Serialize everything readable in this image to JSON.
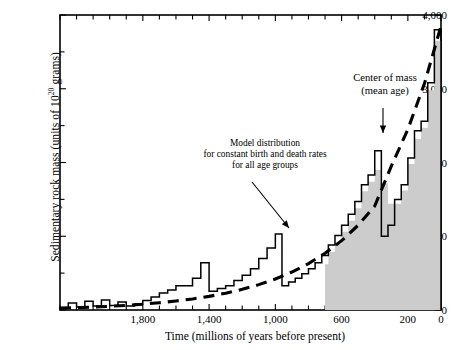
{
  "chart_data": {
    "type": "area",
    "title": "",
    "xlabel": "Time (millions of years before present)",
    "ylabel": "Sedimentary rock mass (units of 10",
    "ylabel_sup": "20",
    "ylabel_tail": " grams)",
    "xlim": [
      2300,
      0
    ],
    "ylim": [
      0,
      4000
    ],
    "x_direction": "decreasing",
    "grid": false,
    "legend": false,
    "xticks": [
      1800,
      1400,
      1000,
      600,
      200,
      0
    ],
    "xticklabels": [
      "1,800",
      "1,400",
      "1,000",
      "600",
      "200",
      "0"
    ],
    "yticks": [
      0,
      1000,
      2000,
      3000,
      4000
    ],
    "yticklabels": [
      "0",
      "1,000",
      "2,000",
      "3,000",
      "4,000"
    ],
    "x_minor_tick_step": 100,
    "y_minor_tick_step": 500,
    "annotations": [
      {
        "name": "model-distribution-annotation",
        "lines": [
          "Model distribution",
          "for constant birth and death rates",
          "for all age groups"
        ],
        "text_x": 265,
        "text_y": 155,
        "arrow_from": [
          252,
          182
        ],
        "arrow_to": [
          289,
          228
        ]
      },
      {
        "name": "center-of-mass-annotation",
        "lines": [
          "Center of mass",
          "(mean age)"
        ],
        "text_x": 385,
        "text_y": 85,
        "arrow_from": [
          383,
          108
        ],
        "arrow_to": [
          383,
          133
        ]
      }
    ],
    "series": [
      {
        "name": "observed-sedimentary-mass",
        "style": "step-outline",
        "color": "#000000",
        "description": "Observed sedimentary rock mass histogram (open staircase outline)",
        "steps": [
          {
            "x0": 2300,
            "x1": 2250,
            "y": 30
          },
          {
            "x0": 2250,
            "x1": 2200,
            "y": 95
          },
          {
            "x0": 2200,
            "x1": 2150,
            "y": 40
          },
          {
            "x0": 2150,
            "x1": 2100,
            "y": 120
          },
          {
            "x0": 2100,
            "x1": 2050,
            "y": 55
          },
          {
            "x0": 2050,
            "x1": 2000,
            "y": 135
          },
          {
            "x0": 2000,
            "x1": 1950,
            "y": 60
          },
          {
            "x0": 1950,
            "x1": 1900,
            "y": 110
          },
          {
            "x0": 1900,
            "x1": 1850,
            "y": 55
          },
          {
            "x0": 1850,
            "x1": 1800,
            "y": 80
          },
          {
            "x0": 1800,
            "x1": 1750,
            "y": 130
          },
          {
            "x0": 1750,
            "x1": 1700,
            "y": 175
          },
          {
            "x0": 1700,
            "x1": 1650,
            "y": 230
          },
          {
            "x0": 1650,
            "x1": 1600,
            "y": 270
          },
          {
            "x0": 1600,
            "x1": 1500,
            "y": 330
          },
          {
            "x0": 1500,
            "x1": 1450,
            "y": 430
          },
          {
            "x0": 1450,
            "x1": 1400,
            "y": 640
          },
          {
            "x0": 1400,
            "x1": 1350,
            "y": 255
          },
          {
            "x0": 1350,
            "x1": 1300,
            "y": 290
          },
          {
            "x0": 1300,
            "x1": 1250,
            "y": 330
          },
          {
            "x0": 1250,
            "x1": 1200,
            "y": 400
          },
          {
            "x0": 1200,
            "x1": 1150,
            "y": 470
          },
          {
            "x0": 1150,
            "x1": 1100,
            "y": 560
          },
          {
            "x0": 1100,
            "x1": 1050,
            "y": 700
          },
          {
            "x0": 1050,
            "x1": 1000,
            "y": 840
          },
          {
            "x0": 1000,
            "x1": 960,
            "y": 1030
          },
          {
            "x0": 960,
            "x1": 920,
            "y": 330
          },
          {
            "x0": 920,
            "x1": 880,
            "y": 380
          },
          {
            "x0": 880,
            "x1": 840,
            "y": 430
          },
          {
            "x0": 840,
            "x1": 800,
            "y": 490
          },
          {
            "x0": 800,
            "x1": 760,
            "y": 560
          },
          {
            "x0": 760,
            "x1": 720,
            "y": 640
          },
          {
            "x0": 720,
            "x1": 680,
            "y": 740
          },
          {
            "x0": 680,
            "x1": 640,
            "y": 880
          },
          {
            "x0": 640,
            "x1": 600,
            "y": 1010
          },
          {
            "x0": 600,
            "x1": 560,
            "y": 1150
          },
          {
            "x0": 560,
            "x1": 520,
            "y": 1300
          },
          {
            "x0": 520,
            "x1": 480,
            "y": 1470
          },
          {
            "x0": 480,
            "x1": 440,
            "y": 1700
          },
          {
            "x0": 440,
            "x1": 400,
            "y": 1830
          },
          {
            "x0": 400,
            "x1": 360,
            "y": 2160
          },
          {
            "x0": 360,
            "x1": 320,
            "y": 1000
          },
          {
            "x0": 320,
            "x1": 280,
            "y": 1150
          },
          {
            "x0": 280,
            "x1": 240,
            "y": 1500
          },
          {
            "x0": 240,
            "x1": 200,
            "y": 1700
          },
          {
            "x0": 200,
            "x1": 160,
            "y": 2060
          },
          {
            "x0": 160,
            "x1": 120,
            "y": 2430
          },
          {
            "x0": 120,
            "x1": 80,
            "y": 2560
          },
          {
            "x0": 80,
            "x1": 40,
            "y": 3080
          },
          {
            "x0": 40,
            "x1": 0,
            "y": 3800
          }
        ]
      },
      {
        "name": "phanerozoic-shaded-mass",
        "style": "step-filled",
        "color": "#cccccc",
        "description": "Shaded (Phanerozoic) portion of observed mass, begins near 700 Ma",
        "steps": [
          {
            "x0": 700,
            "x1": 680,
            "y": 620
          },
          {
            "x0": 680,
            "x1": 640,
            "y": 790
          },
          {
            "x0": 640,
            "x1": 600,
            "y": 900
          },
          {
            "x0": 600,
            "x1": 560,
            "y": 1060
          },
          {
            "x0": 560,
            "x1": 520,
            "y": 1210
          },
          {
            "x0": 520,
            "x1": 480,
            "y": 1380
          },
          {
            "x0": 480,
            "x1": 440,
            "y": 1610
          },
          {
            "x0": 440,
            "x1": 400,
            "y": 1740
          },
          {
            "x0": 400,
            "x1": 360,
            "y": 1900
          },
          {
            "x0": 360,
            "x1": 320,
            "y": 1720
          },
          {
            "x0": 320,
            "x1": 280,
            "y": 1440
          },
          {
            "x0": 280,
            "x1": 240,
            "y": 1440
          },
          {
            "x0": 240,
            "x1": 200,
            "y": 1620
          },
          {
            "x0": 200,
            "x1": 160,
            "y": 1980
          },
          {
            "x0": 160,
            "x1": 120,
            "y": 2320
          },
          {
            "x0": 120,
            "x1": 80,
            "y": 2470
          },
          {
            "x0": 80,
            "x1": 40,
            "y": 2980
          },
          {
            "x0": 40,
            "x1": 0,
            "y": 3650
          }
        ]
      },
      {
        "name": "model-distribution-curve",
        "style": "dashed-curve",
        "color": "#000000",
        "description": "Exponential model distribution for constant birth and death rates",
        "points": [
          {
            "x": 2300,
            "y": 25
          },
          {
            "x": 2200,
            "y": 32
          },
          {
            "x": 2100,
            "y": 40
          },
          {
            "x": 2000,
            "y": 50
          },
          {
            "x": 1900,
            "y": 63
          },
          {
            "x": 1800,
            "y": 79
          },
          {
            "x": 1700,
            "y": 98
          },
          {
            "x": 1600,
            "y": 122
          },
          {
            "x": 1500,
            "y": 150
          },
          {
            "x": 1400,
            "y": 185
          },
          {
            "x": 1300,
            "y": 228
          },
          {
            "x": 1200,
            "y": 280
          },
          {
            "x": 1100,
            "y": 344
          },
          {
            "x": 1000,
            "y": 420
          },
          {
            "x": 900,
            "y": 515
          },
          {
            "x": 800,
            "y": 630
          },
          {
            "x": 700,
            "y": 770
          },
          {
            "x": 600,
            "y": 940
          },
          {
            "x": 500,
            "y": 1150
          },
          {
            "x": 400,
            "y": 1410
          },
          {
            "x": 300,
            "y": 1950
          },
          {
            "x": 200,
            "y": 2450
          },
          {
            "x": 100,
            "y": 3070
          },
          {
            "x": 0,
            "y": 3850
          }
        ]
      }
    ]
  }
}
